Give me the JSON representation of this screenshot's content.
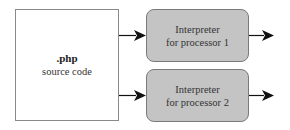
{
  "diagram": {
    "source": {
      "title": ".php",
      "subtitle": "source code"
    },
    "interpreters": [
      {
        "line1": "Interpreter",
        "line2": "for processor 1"
      },
      {
        "line1": "Interpreter",
        "line2": "for processor 2"
      }
    ],
    "colors": {
      "interpreter_fill": "#c4c4c4",
      "border": "#7a7a7a",
      "arrow": "#111111"
    }
  }
}
